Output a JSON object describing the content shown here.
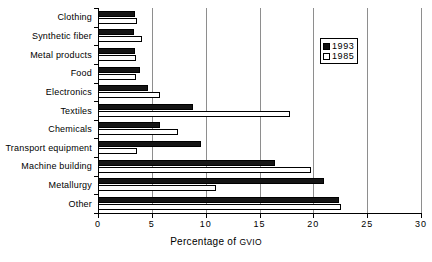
{
  "chart_data": {
    "type": "bar",
    "orientation": "horizontal",
    "title": "",
    "xlabel": "Percentage of GVIO",
    "ylabel": "",
    "xlim": [
      0,
      30
    ],
    "xticks": [
      0,
      5,
      10,
      15,
      20,
      25,
      30
    ],
    "xtick_labels": [
      "0",
      "5",
      "10",
      "15",
      "20",
      "25",
      "30"
    ],
    "grid": true,
    "grid_axis": "x",
    "legend_position": "top-right",
    "categories": [
      "Clothing",
      "Synthetic fiber",
      "Metal products",
      "Food",
      "Electronics",
      "Textiles",
      "Chemicals",
      "Transport equipment",
      "Machine building",
      "Metallurgy",
      "Other"
    ],
    "series": [
      {
        "name": "1993",
        "color": "#111111",
        "values": [
          3.4,
          3.3,
          3.4,
          3.9,
          4.6,
          8.8,
          5.8,
          9.6,
          16.4,
          21.0,
          22.4
        ]
      },
      {
        "name": "1985",
        "color": "#ffffff",
        "values": [
          3.6,
          4.1,
          3.5,
          3.5,
          5.8,
          17.8,
          7.4,
          3.6,
          19.8,
          11.0,
          22.6
        ]
      }
    ]
  },
  "legend": {
    "entries": [
      {
        "label": "1993",
        "swatch": "filled-square"
      },
      {
        "label": "1985",
        "swatch": "hollow-square"
      }
    ]
  },
  "axis": {
    "x_title_main": "Percentage of ",
    "x_title_acronym": "GVIO"
  },
  "colors": {
    "series_1993": "#111111",
    "series_1985": "#ffffff",
    "gridline": "#8e8e8e",
    "axis": "#000000",
    "background": "#ffffff"
  }
}
